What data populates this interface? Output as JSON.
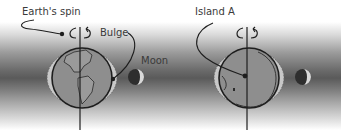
{
  "figure": {
    "type": "tidal bulge diagram",
    "panels": [
      {
        "id": "left",
        "labels": {
          "spin": "Earth's spin",
          "bulge": "Bulge",
          "moon": "Moon"
        }
      },
      {
        "id": "right",
        "labels": {
          "island": "Island A"
        }
      }
    ]
  },
  "colors": {
    "earth_fill": "#8e8e8e",
    "bulge_fill": "#c8c8c8",
    "outline": "#1e1e1e",
    "label": "#3a3a3a",
    "band_dark": "#5a5a5a"
  }
}
